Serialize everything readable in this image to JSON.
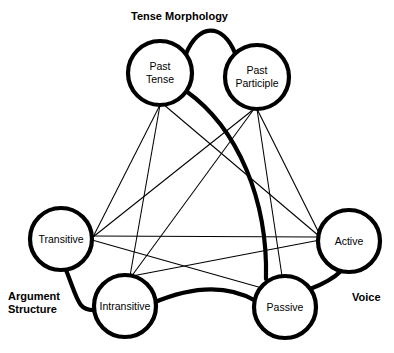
{
  "diagram": {
    "width": 394,
    "height": 353,
    "background_color": "#ffffff",
    "line_color": "#000000",
    "node_fill": "#ffffff",
    "nodes": [
      {
        "id": "past-tense",
        "label_line1": "Past",
        "label_line2": "Tense",
        "cx": 160,
        "cy": 73,
        "r": 32
      },
      {
        "id": "past-participle",
        "label_line1": "Past",
        "label_line2": "Participle",
        "cx": 257,
        "cy": 77,
        "r": 32
      },
      {
        "id": "transitive",
        "label_line1": "Transitive",
        "label_line2": "",
        "cx": 61,
        "cy": 239,
        "r": 31
      },
      {
        "id": "active",
        "label_line1": "Active",
        "label_line2": "",
        "cx": 349,
        "cy": 241,
        "r": 31
      },
      {
        "id": "intransitive",
        "label_line1": "Intransitive",
        "label_line2": "",
        "cx": 125,
        "cy": 306,
        "r": 31
      },
      {
        "id": "passive",
        "label_line1": "Passive",
        "label_line2": "",
        "cx": 285,
        "cy": 307,
        "r": 31
      }
    ],
    "group_labels": {
      "tense_morphology": "Tense Morphology",
      "argument_structure_line1": "Argument",
      "argument_structure_line2": "Structure",
      "voice": "Voice"
    },
    "thick_links": [
      {
        "id": "past-tense--past-participle",
        "from": "past-tense",
        "to": "past-participle"
      },
      {
        "id": "past-tense--passive",
        "from": "past-tense",
        "to": "passive"
      },
      {
        "id": "transitive--intransitive",
        "from": "transitive",
        "to": "intransitive"
      },
      {
        "id": "intransitive--passive",
        "from": "intransitive",
        "to": "passive"
      },
      {
        "id": "passive--active",
        "from": "passive",
        "to": "active"
      }
    ],
    "thin_links": [
      {
        "id": "past-tense--transitive",
        "from": "past-tense",
        "to": "transitive"
      },
      {
        "id": "past-tense--intransitive",
        "from": "past-tense",
        "to": "intransitive"
      },
      {
        "id": "past-tense--active",
        "from": "past-tense",
        "to": "active"
      },
      {
        "id": "past-participle--transitive",
        "from": "past-participle",
        "to": "transitive"
      },
      {
        "id": "past-participle--intransitive",
        "from": "past-participle",
        "to": "intransitive"
      },
      {
        "id": "past-participle--passive",
        "from": "past-participle",
        "to": "passive"
      },
      {
        "id": "past-participle--active",
        "from": "past-participle",
        "to": "active"
      },
      {
        "id": "transitive--active",
        "from": "transitive",
        "to": "active"
      },
      {
        "id": "transitive--passive",
        "from": "transitive",
        "to": "passive"
      },
      {
        "id": "intransitive--active",
        "from": "intransitive",
        "to": "active"
      }
    ]
  }
}
